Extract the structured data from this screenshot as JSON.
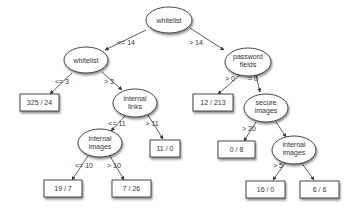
{
  "diagram": {
    "type": "decision-tree",
    "nodes": {
      "root": {
        "label_lines": [
          "whitelist"
        ]
      },
      "whitelist_left": {
        "label_lines": [
          "whitelist"
        ]
      },
      "leaf_325_24": {
        "label": "325 / 24"
      },
      "internal_links": {
        "label_lines": [
          "internal",
          "links"
        ]
      },
      "internal_images_left": {
        "label_lines": [
          "internal",
          "images"
        ]
      },
      "leaf_19_7": {
        "label": "19 / 7"
      },
      "leaf_7_26": {
        "label": "7 / 26"
      },
      "leaf_11_0": {
        "label": "11 / 0"
      },
      "password_fields": {
        "label_lines": [
          "password",
          "fields"
        ]
      },
      "leaf_12_213": {
        "label": "12 / 213"
      },
      "secure_images": {
        "label_lines": [
          "secure",
          "images"
        ]
      },
      "leaf_0_8": {
        "label": "0 / 8"
      },
      "internal_images_right": {
        "label_lines": [
          "internal",
          "images"
        ]
      },
      "leaf_16_0": {
        "label": "16 / 0"
      },
      "leaf_6_6": {
        "label": "6 / 6"
      }
    },
    "edges": {
      "root_left": {
        "label": "<= 14"
      },
      "root_right": {
        "label": "> 14"
      },
      "whitelist_left_left": {
        "label": "<= 3"
      },
      "whitelist_left_right": {
        "label": "> 3"
      },
      "internal_links_left": {
        "label": "<= 11"
      },
      "internal_links_right": {
        "label": "> 11"
      },
      "internal_images_left_left": {
        "label": "<= 10"
      },
      "internal_images_left_right": {
        "label": "> 10"
      },
      "password_fields_left": {
        "label": "> 0"
      },
      "password_fields_right": {
        "label": "= 0"
      },
      "secure_images_left": {
        "label": "> 20"
      },
      "secure_images_right": {
        "label": ""
      },
      "internal_images_right_left": {
        "label": "> 5"
      },
      "internal_images_right_right": {
        "label": ""
      }
    },
    "colors": {
      "stroke": "#333333",
      "fill": "#ffffff",
      "text": "#333333",
      "shadow": "#999999"
    }
  }
}
